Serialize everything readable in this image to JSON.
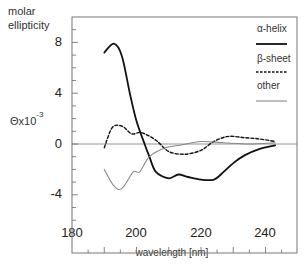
{
  "chart_data": {
    "type": "line",
    "title": "",
    "ylabel": "molar ellipticity",
    "ylabel_units": "Θx10",
    "ylabel_exponent": "-3",
    "xlabel": "wavelength [nm]",
    "xlim": [
      180,
      250
    ],
    "ylim": [
      -6.5,
      10
    ],
    "x_ticks": [
      "180",
      "200",
      "220",
      "240"
    ],
    "y_ticks": [
      "8",
      "4",
      "0",
      "-4"
    ],
    "grid": false,
    "zero_line": true,
    "legend_position": "upper right (inside)",
    "series": [
      {
        "name": "α-helix",
        "style": "solid",
        "color": "#111111",
        "x": [
          190,
          193,
          195.5,
          198,
          200,
          202.5,
          204,
          206,
          210,
          213,
          216,
          220,
          224,
          227,
          230,
          233.5,
          238,
          243
        ],
        "y": [
          7.2,
          7.9,
          6.9,
          3.9,
          1.8,
          0.0,
          -1.0,
          -2.2,
          -2.7,
          -2.4,
          -2.6,
          -2.8,
          -2.8,
          -2.2,
          -1.5,
          -0.9,
          -0.4,
          -0.1
        ]
      },
      {
        "name": "β-sheet",
        "style": "dashed",
        "color": "#111111",
        "x": [
          190,
          192.5,
          195.5,
          198.5,
          201.5,
          206,
          210,
          215,
          220,
          224,
          228.5,
          233.5,
          238,
          243
        ],
        "y": [
          -0.3,
          1.3,
          1.4,
          0.8,
          0.9,
          0.3,
          -0.6,
          -0.8,
          -0.5,
          0.2,
          0.6,
          0.5,
          0.4,
          0.2
        ]
      },
      {
        "name": "other",
        "style": "solid",
        "color": "#888888",
        "x": [
          190,
          193,
          195.5,
          199,
          201,
          204,
          209,
          213.5,
          220,
          227,
          235,
          243
        ],
        "y": [
          -2.0,
          -3.3,
          -3.5,
          -2.2,
          -2.2,
          -1.0,
          -0.3,
          -0.1,
          0.2,
          0.1,
          0.0,
          0.1
        ]
      }
    ]
  },
  "labels": {
    "ylabel_line1": "molar",
    "ylabel_line2": "ellipticity",
    "ylabel_units": "Θx10",
    "ylabel_exponent": "-3",
    "xlabel": "wavelength [nm]",
    "legend": [
      "α-helix",
      "β-sheet",
      "other"
    ],
    "yticks": [
      "8",
      "4",
      "0",
      "-4"
    ],
    "xticks": [
      "180",
      "200",
      "220",
      "240"
    ]
  }
}
